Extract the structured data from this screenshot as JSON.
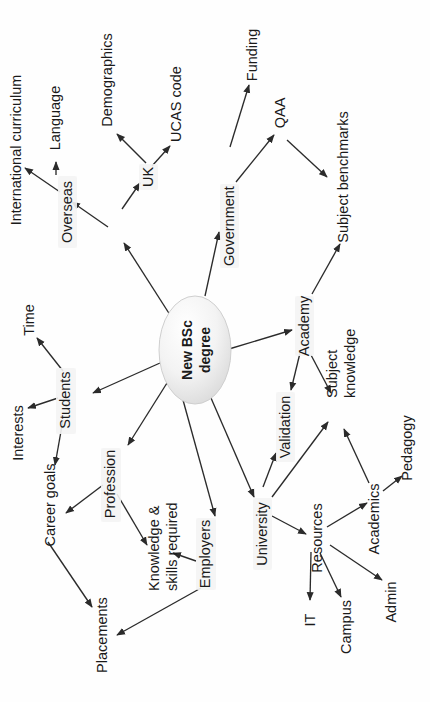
{
  "diagram": {
    "orientation": "rotated-90-ccw",
    "center": {
      "id": "new-bsc-degree",
      "label_line1": "New BSc",
      "label_line2": "degree",
      "shape": "oval",
      "fill": "#f2f2f2",
      "stroke": "#cfcfcf"
    },
    "colors": {
      "background": "#ffffff",
      "text": "#1a1a1a",
      "edge": "#2b2b2b",
      "halo": "#f4f4f4"
    },
    "nodes": [
      {
        "id": "market",
        "label": "Market"
      },
      {
        "id": "overseas",
        "label": "Overseas"
      },
      {
        "id": "language",
        "label": "Language"
      },
      {
        "id": "international-curriculum",
        "label": "International curriculum"
      },
      {
        "id": "uk",
        "label": "UK"
      },
      {
        "id": "demographics",
        "label": "Demographics"
      },
      {
        "id": "ucas-code",
        "label": "UCAS code"
      },
      {
        "id": "government",
        "label": "Government"
      },
      {
        "id": "funding",
        "label": "Funding"
      },
      {
        "id": "qaa",
        "label": "QAA"
      },
      {
        "id": "subject-benchmarks",
        "label": "Subject benchmarks"
      },
      {
        "id": "academy",
        "label": "Academy"
      },
      {
        "id": "validation",
        "label": "Validation"
      },
      {
        "id": "subject-knowledge",
        "label": "Subject knowledge"
      },
      {
        "id": "pedagogy",
        "label": "Pedagogy"
      },
      {
        "id": "academics",
        "label": "Academics"
      },
      {
        "id": "university",
        "label": "University"
      },
      {
        "id": "resources",
        "label": "Resources"
      },
      {
        "id": "it",
        "label": "IT"
      },
      {
        "id": "campus",
        "label": "Campus"
      },
      {
        "id": "admin",
        "label": "Admin"
      },
      {
        "id": "students",
        "label": "Students"
      },
      {
        "id": "time",
        "label": "Time"
      },
      {
        "id": "interests",
        "label": "Interests"
      },
      {
        "id": "career-goals",
        "label": "Career goals"
      },
      {
        "id": "placements",
        "label": "Placements"
      },
      {
        "id": "profession",
        "label": "Profession"
      },
      {
        "id": "knowledge-skills",
        "label_line1": "Knowledge &",
        "label_line2": "skills required"
      },
      {
        "id": "employers",
        "label": "Employers"
      }
    ],
    "edges": [
      {
        "from": "new-bsc-degree",
        "to": "market"
      },
      {
        "from": "new-bsc-degree",
        "to": "government"
      },
      {
        "from": "new-bsc-degree",
        "to": "academy"
      },
      {
        "from": "new-bsc-degree",
        "to": "students"
      },
      {
        "from": "new-bsc-degree",
        "to": "profession"
      },
      {
        "from": "new-bsc-degree",
        "to": "employers"
      },
      {
        "from": "new-bsc-degree",
        "to": "university"
      },
      {
        "from": "market",
        "to": "overseas"
      },
      {
        "from": "market",
        "to": "uk"
      },
      {
        "from": "overseas",
        "to": "language"
      },
      {
        "from": "overseas",
        "to": "international-curriculum"
      },
      {
        "from": "uk",
        "to": "demographics"
      },
      {
        "from": "uk",
        "to": "ucas-code"
      },
      {
        "from": "government",
        "to": "funding"
      },
      {
        "from": "government",
        "to": "qaa"
      },
      {
        "from": "qaa",
        "to": "subject-benchmarks"
      },
      {
        "from": "academy",
        "to": "subject-benchmarks"
      },
      {
        "from": "academy",
        "to": "validation"
      },
      {
        "from": "academy",
        "to": "subject-knowledge"
      },
      {
        "from": "university",
        "to": "validation"
      },
      {
        "from": "university",
        "to": "resources"
      },
      {
        "from": "university",
        "to": "subject-knowledge"
      },
      {
        "from": "resources",
        "to": "it"
      },
      {
        "from": "resources",
        "to": "campus"
      },
      {
        "from": "resources",
        "to": "admin"
      },
      {
        "from": "resources",
        "to": "academics"
      },
      {
        "from": "academics",
        "to": "subject-knowledge"
      },
      {
        "from": "academics",
        "to": "pedagogy"
      },
      {
        "from": "students",
        "to": "time"
      },
      {
        "from": "students",
        "to": "interests"
      },
      {
        "from": "students",
        "to": "career-goals"
      },
      {
        "from": "profession",
        "to": "career-goals"
      },
      {
        "from": "profession",
        "to": "knowledge-skills"
      },
      {
        "from": "employers",
        "to": "knowledge-skills"
      },
      {
        "from": "employers",
        "to": "placements"
      },
      {
        "from": "career-goals",
        "to": "placements"
      }
    ]
  }
}
